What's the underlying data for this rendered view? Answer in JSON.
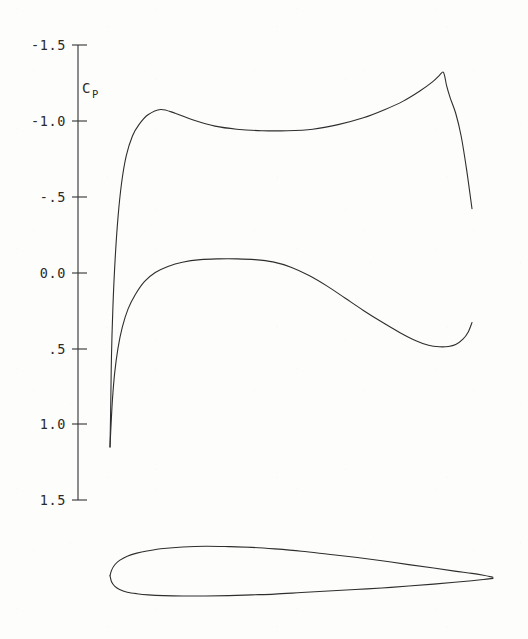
{
  "figure": {
    "kind": "pressure-distribution-with-airfoil",
    "background_color": "#fdfdfc",
    "line_color": "#2e2e2e"
  },
  "axis": {
    "title": "C",
    "title_subscript": "P",
    "title_full": "Cp",
    "orientation": "vertical",
    "inverted": true,
    "x_px": 78,
    "top_px": 45,
    "bottom_px": 500,
    "ticks": [
      {
        "label": "-1.5",
        "value": -1.5,
        "y_px": 45
      },
      {
        "label": "-1.0",
        "value": -1.0,
        "y_px": 121
      },
      {
        "label": "-.5",
        "value": -0.5,
        "y_px": 197
      },
      {
        "label": "0.0",
        "value": 0.0,
        "y_px": 273
      },
      {
        "label": ".5",
        "value": 0.5,
        "y_px": 349
      },
      {
        "label": "1.0",
        "value": 1.0,
        "y_px": 424
      },
      {
        "label": "1.5",
        "value": 1.5,
        "y_px": 500
      }
    ]
  },
  "chart_data": {
    "type": "line",
    "title": "",
    "subtitle": "",
    "xlabel": "",
    "ylabel": "Cp",
    "ylim": [
      1.5,
      -1.5
    ],
    "xlim": [
      0.0,
      1.0
    ],
    "grid": false,
    "legend": "none",
    "y_inverted": true,
    "annotations": [],
    "series": [
      {
        "name": "upper-surface",
        "x": [
          0.0,
          0.002,
          0.004,
          0.008,
          0.014,
          0.022,
          0.032,
          0.045,
          0.062,
          0.08,
          0.105,
          0.14,
          0.18,
          0.23,
          0.29,
          0.35,
          0.42,
          0.49,
          0.56,
          0.63,
          0.7,
          0.76,
          0.81,
          0.855,
          0.89,
          0.91,
          0.92,
          0.925,
          0.93,
          0.94,
          0.955,
          0.97,
          0.985,
          1.0
        ],
        "values": [
          1.15,
          0.88,
          0.56,
          0.23,
          -0.08,
          -0.36,
          -0.59,
          -0.77,
          -0.9,
          -0.975,
          -1.04,
          -1.075,
          -1.05,
          -1.005,
          -0.965,
          -0.945,
          -0.935,
          -0.935,
          -0.945,
          -0.975,
          -1.02,
          -1.075,
          -1.13,
          -1.195,
          -1.255,
          -1.3,
          -1.322,
          -1.29,
          -1.23,
          -1.15,
          -1.05,
          -0.9,
          -0.68,
          -0.42
        ]
      },
      {
        "name": "lower-surface",
        "x": [
          0.0,
          0.003,
          0.007,
          0.013,
          0.022,
          0.034,
          0.05,
          0.07,
          0.095,
          0.125,
          0.16,
          0.2,
          0.25,
          0.3,
          0.35,
          0.4,
          0.45,
          0.5,
          0.55,
          0.6,
          0.65,
          0.7,
          0.75,
          0.8,
          0.845,
          0.88,
          0.91,
          0.935,
          0.955,
          0.975,
          0.99,
          1.0
        ],
        "values": [
          1.15,
          1.0,
          0.83,
          0.66,
          0.5,
          0.36,
          0.24,
          0.145,
          0.06,
          0.0,
          -0.04,
          -0.068,
          -0.085,
          -0.09,
          -0.09,
          -0.085,
          -0.07,
          -0.035,
          0.02,
          0.09,
          0.17,
          0.25,
          0.325,
          0.395,
          0.45,
          0.48,
          0.49,
          0.488,
          0.475,
          0.44,
          0.39,
          0.33
        ]
      }
    ]
  },
  "airfoil": {
    "name": "airfoil-profile",
    "chord_start_px": 110,
    "chord_end_px": 493,
    "centerline_px": 578,
    "upper_x": [
      0.0,
      0.004,
      0.012,
      0.025,
      0.045,
      0.07,
      0.1,
      0.14,
      0.19,
      0.25,
      0.31,
      0.37,
      0.43,
      0.5,
      0.57,
      0.64,
      0.71,
      0.78,
      0.845,
      0.9,
      0.945,
      0.975,
      1.0
    ],
    "upper_y": [
      0.006,
      0.02,
      0.034,
      0.046,
      0.057,
      0.065,
      0.071,
      0.077,
      0.081,
      0.083,
      0.082,
      0.08,
      0.076,
      0.07,
      0.062,
      0.054,
      0.045,
      0.035,
      0.026,
      0.018,
      0.012,
      0.007,
      0.002
    ],
    "lower_x": [
      0.0,
      0.004,
      0.012,
      0.025,
      0.045,
      0.07,
      0.1,
      0.14,
      0.19,
      0.25,
      0.31,
      0.37,
      0.43,
      0.5,
      0.57,
      0.64,
      0.71,
      0.78,
      0.845,
      0.9,
      0.945,
      0.975,
      1.0
    ],
    "lower_y": [
      0.006,
      -0.01,
      -0.021,
      -0.03,
      -0.037,
      -0.041,
      -0.044,
      -0.046,
      -0.047,
      -0.047,
      -0.046,
      -0.044,
      -0.042,
      -0.038,
      -0.034,
      -0.03,
      -0.026,
      -0.021,
      -0.016,
      -0.011,
      -0.007,
      -0.004,
      -0.001
    ]
  }
}
